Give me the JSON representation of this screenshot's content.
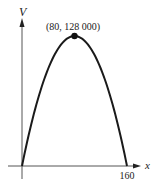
{
  "chart_data": {
    "type": "line",
    "title": "",
    "xlabel": "x",
    "ylabel": "V",
    "x": [
      0,
      20,
      40,
      60,
      80,
      100,
      120,
      140,
      160
    ],
    "series": [
      {
        "name": "V(x)",
        "values": [
          0,
          56000,
          96000,
          120000,
          128000,
          120000,
          96000,
          56000,
          0
        ]
      }
    ],
    "annotations": [
      {
        "text": "(80, 128 000)",
        "x": 80,
        "y": 128000,
        "marker": "dot"
      }
    ],
    "x_ticks": [
      "160"
    ],
    "xlim": [
      0,
      160
    ],
    "ylim": [
      0,
      128000
    ],
    "grid": false,
    "legend": "none"
  },
  "labels": {
    "y_axis": "V",
    "x_axis": "x",
    "x_tick_160": "160",
    "vertex": "(80, 128 000)"
  },
  "colors": {
    "curve": "#1a1a1a",
    "axis": "#555555"
  }
}
